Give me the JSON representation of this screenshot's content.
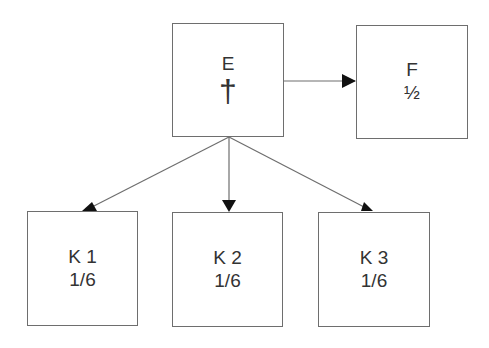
{
  "diagram": {
    "nodes": [
      {
        "id": "E",
        "label": "E",
        "sub": "†",
        "sub_meaning": "deceased"
      },
      {
        "id": "F",
        "label": "F",
        "sub": "½"
      },
      {
        "id": "K1",
        "label": "K 1",
        "sub": "1/6"
      },
      {
        "id": "K2",
        "label": "K 2",
        "sub": "1/6"
      },
      {
        "id": "K3",
        "label": "K 3",
        "sub": "1/6"
      }
    ],
    "edges": [
      {
        "from": "E",
        "to": "F"
      },
      {
        "from": "E",
        "to": "K1"
      },
      {
        "from": "E",
        "to": "K2"
      },
      {
        "from": "E",
        "to": "K3"
      }
    ],
    "colors": {
      "stroke": "#6e6e6e",
      "arrow": "#111111",
      "text": "#333333"
    }
  }
}
